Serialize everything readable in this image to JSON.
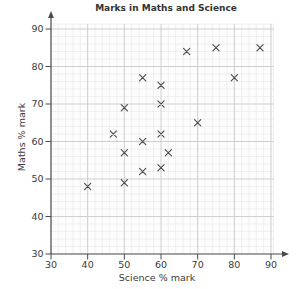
{
  "chart_data": {
    "type": "scatter",
    "title": "Marks in Maths and Science",
    "xlabel": "Science % mark",
    "ylabel": "Maths % mark",
    "xlim": [
      30,
      92
    ],
    "ylim": [
      30,
      92
    ],
    "xticks": [
      30,
      40,
      50,
      60,
      70,
      80,
      90
    ],
    "yticks": [
      30,
      40,
      50,
      60,
      70,
      80,
      90
    ],
    "minor_step": 2,
    "grid": "major+minor",
    "legend": "none",
    "marker": "x",
    "points": [
      {
        "science": 40,
        "maths": 48
      },
      {
        "science": 47,
        "maths": 62
      },
      {
        "science": 50,
        "maths": 49
      },
      {
        "science": 50,
        "maths": 57
      },
      {
        "science": 50,
        "maths": 69
      },
      {
        "science": 55,
        "maths": 52
      },
      {
        "science": 55,
        "maths": 60
      },
      {
        "science": 55,
        "maths": 77
      },
      {
        "science": 60,
        "maths": 53
      },
      {
        "science": 60,
        "maths": 62
      },
      {
        "science": 60,
        "maths": 70
      },
      {
        "science": 60,
        "maths": 75
      },
      {
        "science": 62,
        "maths": 57
      },
      {
        "science": 67,
        "maths": 84
      },
      {
        "science": 70,
        "maths": 65
      },
      {
        "science": 75,
        "maths": 85
      },
      {
        "science": 80,
        "maths": 77
      },
      {
        "science": 87,
        "maths": 85
      }
    ],
    "colors": {
      "marker": "#4d4d4d",
      "axis": "#4a4a4a",
      "major_grid": "#c9c9cd",
      "minor_grid": "#e7e7ea",
      "text": "#3a3a3a",
      "plot_background": "#fdfdfe",
      "page_background": "#ffffff"
    }
  }
}
